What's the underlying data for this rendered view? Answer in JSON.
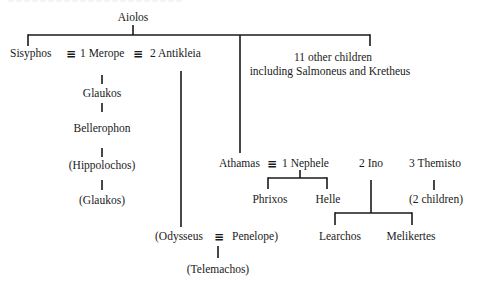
{
  "diagram": {
    "type": "family-tree",
    "root": "Aiolos",
    "nodes": {
      "aiolos": "Aiolos",
      "sisyphos": "Sisyphos",
      "merope": "1 Merope",
      "antikleia": "2 Antikleia",
      "other_children_line1": "11 other children",
      "other_children_line2": "including Salmoneus and Kretheus",
      "glaukos": "Glaukos",
      "bellerophon": "Bellerophon",
      "hippolochos": "(Hippolochos)",
      "glaukos2": "(Glaukos)",
      "athamas": "Athamas",
      "nephele": "1 Nephele",
      "ino": "2 Ino",
      "themisto": "3 Themisto",
      "phrixos": "Phrixos",
      "helle": "Helle",
      "themisto_children": "(2 children)",
      "learchos": "Learchos",
      "melikertes": "Melikertes",
      "odysseus": "(Odysseus",
      "penelope": "Penelope)",
      "telemachos": "(Telemachos)"
    },
    "marriage_symbol": "≡",
    "edges": [
      [
        "Aiolos",
        "Sisyphos"
      ],
      [
        "Aiolos",
        "Athamas"
      ],
      [
        "Aiolos",
        "11 other children"
      ],
      [
        "Sisyphos + Merope",
        "Glaukos"
      ],
      [
        "Glaukos",
        "Bellerophon"
      ],
      [
        "Bellerophon",
        "Hippolochos"
      ],
      [
        "Hippolochos",
        "Glaukos (II)"
      ],
      [
        "Sisyphos + Antikleia",
        "Odysseus"
      ],
      [
        "Odysseus + Penelope",
        "Telemachos"
      ],
      [
        "Athamas + Nephele",
        "Phrixos"
      ],
      [
        "Athamas + Nephele",
        "Helle"
      ],
      [
        "Athamas + Ino",
        "Learchos"
      ],
      [
        "Athamas + Ino",
        "Melikertes"
      ],
      [
        "Athamas + Themisto",
        "2 children"
      ]
    ],
    "line_color": "#1a1a1a"
  }
}
